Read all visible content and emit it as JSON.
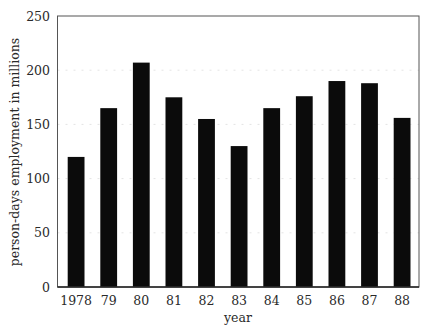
{
  "chart_data": {
    "type": "bar",
    "title": "",
    "xlabel": "year",
    "ylabel": "person-days employment in millions",
    "categories": [
      "1978",
      "79",
      "80",
      "81",
      "82",
      "83",
      "84",
      "85",
      "86",
      "87",
      "88"
    ],
    "values": [
      120,
      165,
      207,
      175,
      155,
      130,
      165,
      176,
      190,
      188,
      156
    ],
    "ylim": [
      0,
      250
    ],
    "yticks": [
      0,
      50,
      100,
      150,
      200,
      250
    ],
    "ytick_labels": [
      "0",
      "50",
      "100",
      "150",
      "200",
      "250"
    ],
    "grid": "faint dotted horizontal",
    "legend": "none",
    "bar_color": "#0b0b0b"
  }
}
